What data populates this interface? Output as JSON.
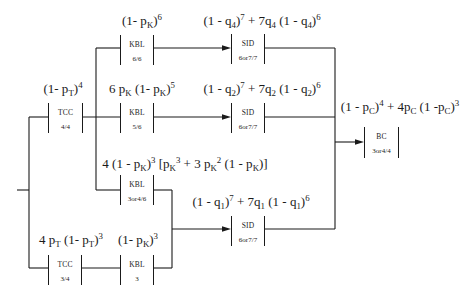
{
  "colors": {
    "background": "#ffffff",
    "line": "#1a1a1a",
    "text": "#1a1a1a"
  },
  "blocks": [
    {
      "name": "TCC",
      "spec": "4/4"
    },
    {
      "name": "KBL",
      "spec": "6/6"
    },
    {
      "name": "KBL",
      "spec": "5/6"
    },
    {
      "name": "KBL",
      "spec": "3or4/6"
    },
    {
      "name": "TCC",
      "spec": "3/4"
    },
    {
      "name": "KBL",
      "spec": "3"
    },
    {
      "name": "SID",
      "spec": "6or7/7"
    },
    {
      "name": "SID",
      "spec": "6or7/7"
    },
    {
      "name": "SID",
      "spec": "6or7/7"
    },
    {
      "name": "BC",
      "spec": "3or4/4"
    }
  ],
  "formulas": [
    {
      "segments": [
        {
          "text": "(1- p",
          "pos": "base"
        },
        {
          "text": "K",
          "pos": "sub"
        },
        {
          "text": ")",
          "pos": "base"
        },
        {
          "text": "6",
          "pos": "sup"
        }
      ]
    },
    {
      "segments": [
        {
          "text": "(1 - q",
          "pos": "base"
        },
        {
          "text": "4",
          "pos": "sub"
        },
        {
          "text": ")",
          "pos": "base"
        },
        {
          "text": "7",
          "pos": "sup"
        },
        {
          "text": " + 7q",
          "pos": "base"
        },
        {
          "text": "4",
          "pos": "sub"
        },
        {
          "text": " (1 - q",
          "pos": "base"
        },
        {
          "text": "4",
          "pos": "sub"
        },
        {
          "text": ")",
          "pos": "base"
        },
        {
          "text": "6",
          "pos": "sup"
        }
      ]
    },
    {
      "segments": [
        {
          "text": "(1- p",
          "pos": "base"
        },
        {
          "text": "T",
          "pos": "sub"
        },
        {
          "text": ")",
          "pos": "base"
        },
        {
          "text": "4",
          "pos": "sup"
        }
      ]
    },
    {
      "segments": [
        {
          "text": "6 p",
          "pos": "base"
        },
        {
          "text": "K",
          "pos": "sub"
        },
        {
          "text": " (1- p",
          "pos": "base"
        },
        {
          "text": "K",
          "pos": "sub"
        },
        {
          "text": ")",
          "pos": "base"
        },
        {
          "text": "5",
          "pos": "sup"
        }
      ]
    },
    {
      "segments": [
        {
          "text": "(1 - q",
          "pos": "base"
        },
        {
          "text": "2",
          "pos": "sub"
        },
        {
          "text": ")",
          "pos": "base"
        },
        {
          "text": "7",
          "pos": "sup"
        },
        {
          "text": " + 7q",
          "pos": "base"
        },
        {
          "text": "2",
          "pos": "sub"
        },
        {
          "text": " (1 - q",
          "pos": "base"
        },
        {
          "text": "2",
          "pos": "sub"
        },
        {
          "text": ")",
          "pos": "base"
        },
        {
          "text": "6",
          "pos": "sup"
        }
      ]
    },
    {
      "segments": [
        {
          "text": "(1 - p",
          "pos": "base"
        },
        {
          "text": "C",
          "pos": "sub"
        },
        {
          "text": ")",
          "pos": "base"
        },
        {
          "text": "4",
          "pos": "sup"
        },
        {
          "text": " + 4p",
          "pos": "base"
        },
        {
          "text": "C",
          "pos": "sub"
        },
        {
          "text": " (1 -p",
          "pos": "base"
        },
        {
          "text": "C",
          "pos": "sub"
        },
        {
          "text": ")",
          "pos": "base"
        },
        {
          "text": "3",
          "pos": "sup"
        }
      ]
    },
    {
      "segments": [
        {
          "text": "4 (1 - p",
          "pos": "base"
        },
        {
          "text": "K",
          "pos": "sub"
        },
        {
          "text": ")",
          "pos": "base"
        },
        {
          "text": "3",
          "pos": "sup"
        },
        {
          "text": " [p",
          "pos": "base"
        },
        {
          "text": "K",
          "pos": "sub"
        },
        {
          "text": "3",
          "pos": "sup"
        },
        {
          "text": " + 3 p",
          "pos": "base"
        },
        {
          "text": "K",
          "pos": "sub"
        },
        {
          "text": "2",
          "pos": "sup"
        },
        {
          "text": " (1 - p",
          "pos": "base"
        },
        {
          "text": "K",
          "pos": "sub"
        },
        {
          "text": ")]",
          "pos": "base"
        }
      ]
    },
    {
      "segments": [
        {
          "text": "(1 - q",
          "pos": "base"
        },
        {
          "text": "1",
          "pos": "sub"
        },
        {
          "text": ")",
          "pos": "base"
        },
        {
          "text": "7",
          "pos": "sup"
        },
        {
          "text": " + 7q",
          "pos": "base"
        },
        {
          "text": "1",
          "pos": "sub"
        },
        {
          "text": " (1 - q",
          "pos": "base"
        },
        {
          "text": "1",
          "pos": "sub"
        },
        {
          "text": ")",
          "pos": "base"
        },
        {
          "text": "6",
          "pos": "sup"
        }
      ]
    },
    {
      "segments": [
        {
          "text": "4 p",
          "pos": "base"
        },
        {
          "text": "T",
          "pos": "sub"
        },
        {
          "text": " (1- p",
          "pos": "base"
        },
        {
          "text": "T",
          "pos": "sub"
        },
        {
          "text": ")",
          "pos": "base"
        },
        {
          "text": "3",
          "pos": "sup"
        }
      ]
    },
    {
      "segments": [
        {
          "text": "(1- p",
          "pos": "base"
        },
        {
          "text": "K",
          "pos": "sub"
        },
        {
          "text": ")",
          "pos": "base"
        },
        {
          "text": "3",
          "pos": "sup"
        }
      ]
    }
  ]
}
